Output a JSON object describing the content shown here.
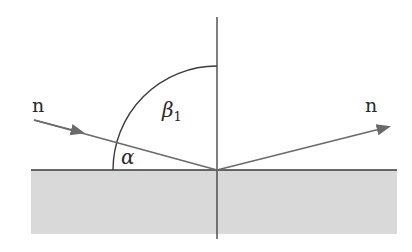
{
  "diagram": {
    "labels": {
      "incident_n": "n",
      "reflected_n": "n",
      "beta": "β",
      "beta_sub": "1",
      "alpha": "α"
    },
    "colors": {
      "background": "#ffffff",
      "medium_fill": "#d9d9d9",
      "line": "#3a3a3a",
      "ray": "#6a6a6a"
    },
    "geometry": {
      "surface_y": 170,
      "surface_x_range": [
        31,
        397
      ],
      "medium_bottom_y": 234,
      "normal_x": 217,
      "normal_y_range": [
        17,
        239
      ],
      "point_of_incidence": [
        217,
        170
      ],
      "incident_ray_start": [
        34,
        120
      ],
      "reflected_ray_end": [
        388,
        127
      ],
      "arc_radius": 104
    }
  }
}
